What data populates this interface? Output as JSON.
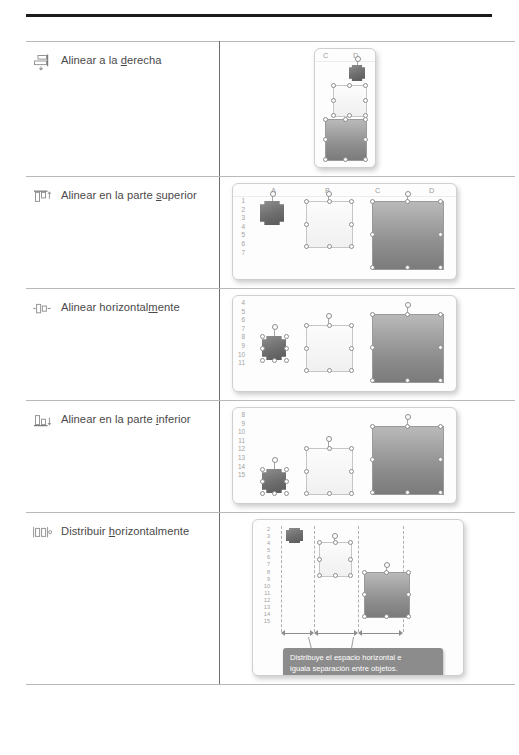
{
  "document": {
    "language": "es",
    "has_top_rule": true
  },
  "table": {
    "columns": [
      "Comando",
      "Ilustración"
    ],
    "rows": [
      {
        "icon": "align-right-icon",
        "label_before": "Alinear a la ",
        "label_accel": "d",
        "label_after": "erecha",
        "label_full": "Alinear a la derecha",
        "figure": {
          "kind": "excel-narrow",
          "column_headers": [
            "C",
            "D"
          ],
          "row_headers": [],
          "shapes": [
            {
              "name": "star-shape",
              "fill": "dark-gradient"
            },
            {
              "name": "rounded-rectangle-shape",
              "fill": "white-gradient"
            },
            {
              "name": "rectangle-shape",
              "fill": "gray-gradient"
            }
          ]
        }
      },
      {
        "icon": "align-top-icon",
        "label_before": "Alinear en la parte ",
        "label_accel": "s",
        "label_after": "uperior",
        "label_full": "Alinear en la parte superior",
        "figure": {
          "kind": "excel-wide",
          "column_headers": [
            "A",
            "B",
            "C",
            "D"
          ],
          "row_headers": [
            "1",
            "2",
            "3",
            "4",
            "5",
            "6",
            "7"
          ],
          "shapes": [
            {
              "name": "star-shape",
              "fill": "dark-gradient"
            },
            {
              "name": "rounded-rectangle-shape",
              "fill": "white-gradient"
            },
            {
              "name": "rectangle-shape",
              "fill": "gray-gradient"
            }
          ]
        }
      },
      {
        "icon": "align-middle-icon",
        "label_before": "Alinear horizontal",
        "label_accel": "m",
        "label_after": "ente",
        "label_full": "Alinear horizontalmente",
        "figure": {
          "kind": "excel-wide",
          "column_headers": [],
          "row_headers": [
            "4",
            "5",
            "6",
            "7",
            "8",
            "9",
            "10",
            "11"
          ],
          "shapes": [
            {
              "name": "star-shape",
              "fill": "dark-gradient"
            },
            {
              "name": "rounded-rectangle-shape",
              "fill": "white-gradient"
            },
            {
              "name": "rectangle-shape",
              "fill": "gray-gradient"
            }
          ]
        }
      },
      {
        "icon": "align-bottom-icon",
        "label_before": "Alinear en la parte ",
        "label_accel": "i",
        "label_after": "nferior",
        "label_full": "Alinear en la parte inferior",
        "figure": {
          "kind": "excel-wide",
          "column_headers": [],
          "row_headers": [
            "8",
            "9",
            "10",
            "11",
            "12",
            "13",
            "14",
            "15"
          ],
          "shapes": [
            {
              "name": "star-shape",
              "fill": "dark-gradient"
            },
            {
              "name": "rounded-rectangle-shape",
              "fill": "white-gradient"
            },
            {
              "name": "rectangle-shape",
              "fill": "gray-gradient"
            }
          ]
        }
      },
      {
        "icon": "distribute-horizontally-icon",
        "label_before": "Distribuir ",
        "label_accel": "h",
        "label_after": "orizontalmente",
        "label_full": "Distribuir horizontalmente",
        "figure": {
          "kind": "excel-tall",
          "column_headers": [],
          "row_headers": [
            "2",
            "3",
            "4",
            "5",
            "6",
            "7",
            "8",
            "9",
            "10",
            "11",
            "12",
            "13",
            "14",
            "15"
          ],
          "shapes": [
            {
              "name": "star-shape",
              "fill": "dark-gradient"
            },
            {
              "name": "rounded-rectangle-shape",
              "fill": "white-gradient"
            },
            {
              "name": "rectangle-shape",
              "fill": "gray-gradient"
            }
          ],
          "callout": {
            "line1": "Distribuye el espacio horizontal e",
            "line2": "iguala separación entre objetos.",
            "text": "Distribuye el espacio horizontal e iguala separación entre objetos.",
            "background": "#8c8c8c",
            "color": "#ffffff"
          }
        }
      }
    ]
  },
  "colors": {
    "rule": "#1a1a1a",
    "cell_border": "#b9b9b9",
    "divider": "#6e6e6e",
    "text": "#4a4a4a",
    "callout_bg": "#8c8c8c"
  }
}
